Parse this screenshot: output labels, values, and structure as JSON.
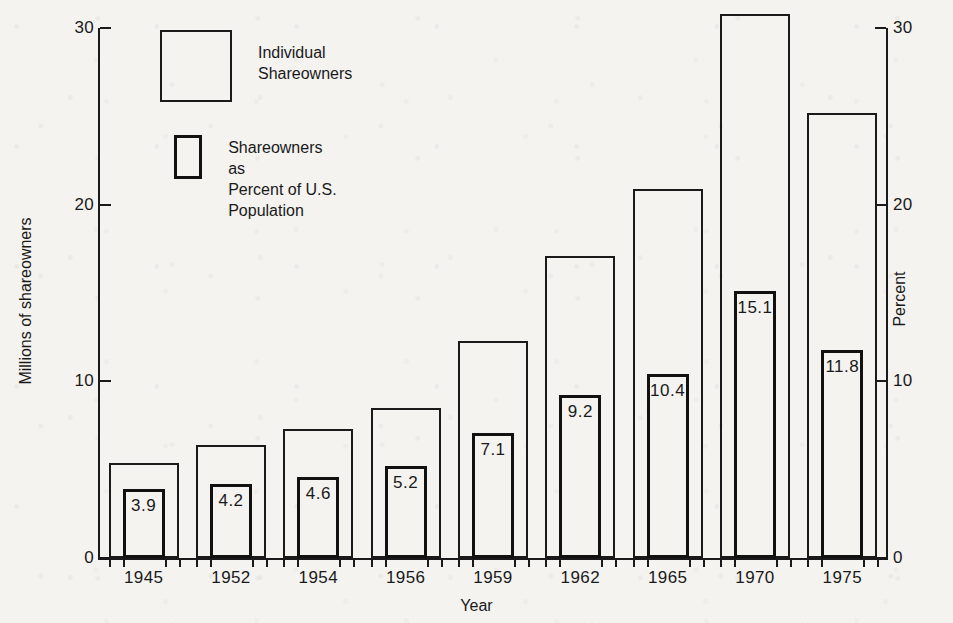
{
  "chart_data": {
    "type": "bar",
    "title": "",
    "subtitle": "",
    "xlabel": "Year",
    "ylabel": "Millions of shareowners",
    "ylabel_right": "Percent",
    "categories": [
      "1945",
      "1952",
      "1954",
      "1956",
      "1959",
      "1962",
      "1965",
      "1970",
      "1975"
    ],
    "ylim": [
      0,
      30
    ],
    "ylim_right": [
      0,
      30
    ],
    "yticks": [
      "0",
      "10",
      "20",
      "30"
    ],
    "ytick_values": [
      0,
      10,
      20,
      30
    ],
    "yticks_right": [
      "0",
      "10",
      "20",
      "30"
    ],
    "ytick_values_right": [
      0,
      10,
      20,
      30
    ],
    "grid": false,
    "legend_position": "top-left",
    "series": [
      {
        "name": "Individual Shareowners",
        "axis": "left",
        "units": "millions",
        "values": [
          5.4,
          6.4,
          7.3,
          8.5,
          12.3,
          17.1,
          20.9,
          30.8,
          25.2
        ],
        "labels": [
          "",
          "",
          "",
          "",
          "",
          "",
          "",
          "",
          ""
        ]
      },
      {
        "name": "Shareowners as Percent of U.S. Population",
        "axis": "right",
        "units": "percent",
        "values": [
          3.9,
          4.2,
          4.6,
          5.2,
          7.1,
          9.2,
          10.4,
          15.1,
          11.8
        ],
        "labels": [
          "3.9",
          "4.2",
          "4.6",
          "5.2",
          "7.1",
          "9.2",
          "10.4",
          "15.1",
          "11.8"
        ]
      }
    ]
  },
  "legend": {
    "items": [
      {
        "label": "Individual\nShareowners",
        "swatch": "outline-thin-square"
      },
      {
        "label": "Shareowners as\nPercent of U.S. Population",
        "swatch": "outline-thick-square"
      }
    ]
  },
  "colors": {
    "ink": "#1a1a1a",
    "paper": "#f4f3f0"
  }
}
